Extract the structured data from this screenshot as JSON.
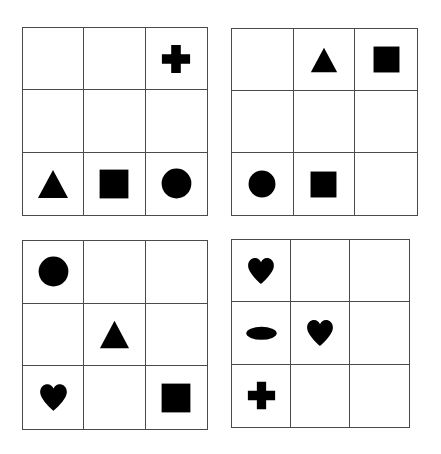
{
  "board": {
    "title": "Four 3x3 shape grids",
    "background_color": "#ffffff",
    "grid_line_color": "#4a4a4a",
    "shape_color": "#000000",
    "panels": [
      {
        "id": "top-left",
        "name": "top-left-grid",
        "rows": 3,
        "cols": 3,
        "cells": [
          {
            "row": 1,
            "col": 1,
            "shape": ""
          },
          {
            "row": 1,
            "col": 2,
            "shape": ""
          },
          {
            "row": 1,
            "col": 3,
            "shape": "cross"
          },
          {
            "row": 2,
            "col": 1,
            "shape": ""
          },
          {
            "row": 2,
            "col": 2,
            "shape": ""
          },
          {
            "row": 2,
            "col": 3,
            "shape": ""
          },
          {
            "row": 3,
            "col": 1,
            "shape": "triangle"
          },
          {
            "row": 3,
            "col": 2,
            "shape": "square"
          },
          {
            "row": 3,
            "col": 3,
            "shape": "circle"
          }
        ]
      },
      {
        "id": "top-right",
        "name": "top-right-grid",
        "rows": 3,
        "cols": 3,
        "cells": [
          {
            "row": 1,
            "col": 1,
            "shape": ""
          },
          {
            "row": 1,
            "col": 2,
            "shape": "triangle"
          },
          {
            "row": 1,
            "col": 3,
            "shape": "square"
          },
          {
            "row": 2,
            "col": 1,
            "shape": ""
          },
          {
            "row": 2,
            "col": 2,
            "shape": ""
          },
          {
            "row": 2,
            "col": 3,
            "shape": ""
          },
          {
            "row": 3,
            "col": 1,
            "shape": "circle"
          },
          {
            "row": 3,
            "col": 2,
            "shape": "square"
          },
          {
            "row": 3,
            "col": 3,
            "shape": ""
          }
        ]
      },
      {
        "id": "bottom-left",
        "name": "bottom-left-grid",
        "rows": 3,
        "cols": 3,
        "cells": [
          {
            "row": 1,
            "col": 1,
            "shape": "circle"
          },
          {
            "row": 1,
            "col": 2,
            "shape": ""
          },
          {
            "row": 1,
            "col": 3,
            "shape": ""
          },
          {
            "row": 2,
            "col": 1,
            "shape": ""
          },
          {
            "row": 2,
            "col": 2,
            "shape": "triangle"
          },
          {
            "row": 2,
            "col": 3,
            "shape": ""
          },
          {
            "row": 3,
            "col": 1,
            "shape": "heart"
          },
          {
            "row": 3,
            "col": 2,
            "shape": ""
          },
          {
            "row": 3,
            "col": 3,
            "shape": "square"
          }
        ]
      },
      {
        "id": "bottom-right",
        "name": "bottom-right-grid",
        "rows": 3,
        "cols": 3,
        "cells": [
          {
            "row": 1,
            "col": 1,
            "shape": "heart"
          },
          {
            "row": 1,
            "col": 2,
            "shape": ""
          },
          {
            "row": 1,
            "col": 3,
            "shape": ""
          },
          {
            "row": 2,
            "col": 1,
            "shape": "ellipse"
          },
          {
            "row": 2,
            "col": 2,
            "shape": "heart"
          },
          {
            "row": 2,
            "col": 3,
            "shape": ""
          },
          {
            "row": 3,
            "col": 1,
            "shape": "cross"
          },
          {
            "row": 3,
            "col": 2,
            "shape": ""
          },
          {
            "row": 3,
            "col": 3,
            "shape": ""
          }
        ]
      }
    ]
  }
}
